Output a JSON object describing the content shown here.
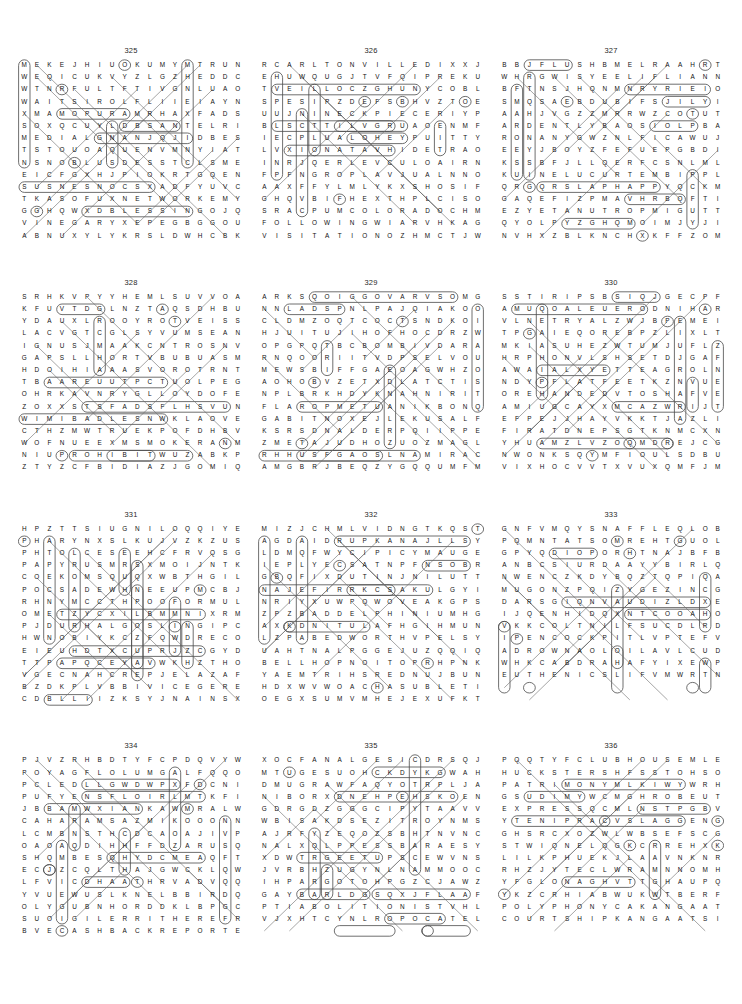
{
  "page": {
    "grid_columns": 18,
    "grid_rows": 15,
    "puzzle_count": 12
  },
  "puzzles": [
    {
      "number": "325",
      "rows": [
        "MEKEJHIUOKUMYMTRUNDU",
        "WEQICUKVYZLGZHEDDCEV",
        "WTNRFULTFTIVGNLUAOTQ",
        "WAITSIROLFLIIEIAYNAI",
        "XMAMOPURAMRHAXFADSUN",
        "SOXQCUYLDBSANTELRIQT",
        "MEDIALGNANJQJIDBESIE",
        "TSTOUOAQUENVMNYIATTR",
        "NSNOBLUSDESSTCLSMENM",
        "EICFGXHJPIOKRTGQENAI",
        "SUSNESNOCSXADFYUVCMN",
        "TKASOFUXNETWORKEMYMG",
        "GGHQWXDBLESSINGOJQIL",
        "VINEGARYXEPEGBGGOUQE",
        "ABNUXYLYKRSLDWHCBKGE"
      ]
    },
    {
      "number": "326",
      "rows": [
        "RCARLTONVILLEDIXXJSB",
        "EHUWQUGJTVFQIPREKURR",
        "TVEILLOCZGHUNYCOBLOE",
        "SPESIPZDEFSBHVZTOEUA",
        "UUJNINECKPIECERIYPST",
        "BLSCTTILVGRUAOENMFTH",
        "IECPLUALOHEYPUITTYAE",
        "LVXIONATAVHIDETRAOBR",
        "INRJQERLEVCULOAIRNOR",
        "FPFNGROPLAVJUALNNOUT",
        "AAXFFYLMLYKXSHOSIFTH",
        "GHQVBIFHEXTHPLCISOGJ",
        "SRACPUMCOLORADOCHMLY",
        "FOLLOWINGWIARVHKAGZK",
        "VISITATIONOZHMCTJWHP"
      ]
    },
    {
      "number": "327",
      "rows": [
        "BBJFLUSHBMELRAAHRTGR",
        "WHRGWISYEELIFLIANNME",
        "BFTNSJHQNMNRYRIEIOSS",
        "SMQSAEBDUBIFSJILYIMU",
        "AAHJVGZZMRRWZCOTUTGR",
        "ARDENTLYBAOSIOLPBAFR",
        "RONANYGWZNLFICAWUJCT",
        "EEYJBOYZFEFUEPGBDIPC",
        "KSSBFJLLQERFCSNLMLZT",
        "KUINELUCURTEMBIPPLML",
        "QRGQRSLAPHAPPYQCKMLJ",
        "GAQEFIZPMAVHRBQFTIRF",
        "EZYETANUTROPMIGUTTAU",
        "QYOLPYZGHQMOIMJYJIFJ",
        "NVHXZBLKNCHXKFFZOMJS"
      ]
    },
    {
      "number": "328",
      "rows": [
        "SRHKVPYYHEMLSUVVOARO",
        "KFUVTDGLNZTAQSDHBUBX",
        "YDAUXLROOYROTVEISSAL",
        "LACVGTCGLSYVUMSEANW",
        "IGNUSJMAAKCNTROSNVQ",
        "GAPSLLHORTVBUBUASMOG",
        "HDOIHIAAASVOROTRNT",
        "TBAAREUUTPCTUOLPEGEAZ",
        "OHRKAVNRYGLLOYDOFEHF",
        "ZOXXSTSFADSFLHSVUNQQ",
        "WIMIBADLESNWKLAOVEMC",
        "CTHZMWTRUEKPOFDHBVNE",
        "WOFNUEEXMSMOKERANMMV",
        "NIUPROHIBITWUZABKPDS",
        "ZTYZCFBIDIAZJGOMIQOC"
      ]
    },
    {
      "number": "329",
      "rows": [
        "ARKSQOIGGOVARVSOMGYR",
        "NNLADSPNLPAJQIAKOOEE",
        "CLDMZOQTCOCTSNDKOIJE",
        "HJUITUJIHOFHOCDRZWTJ",
        "OPGPQTBCBOMBIVDARAAS",
        "RNQOORIITVDPSELVOUUS",
        "MEWSBIFFGAEOAGWHZOFP",
        "AOHOBVZETXDLATCTISEX",
        "NPLBRKHDYKNAHNIRITLT",
        "FLAROPMETUANIKBONQJP",
        "GABITNOXEJLEKUSALFJQ",
        "KSRSDNALDERPQIIPPEUL",
        "ZMETAJUDHOZUOZMAGLJV",
        "RHHUSFGAOSLNAMIRACLE",
        "AMGBRJBEQZYGQQUMFMYX"
      ]
    },
    {
      "number": "330",
      "rows": [
        "SSTIRIPSBSIQJGECPFI",
        "AMUQOALEUERODNIHARN",
        "VLNETRYALZWJBPEMEIA",
        "TPGAIEQOREBPZLIXLTT",
        "MKIASUHEZWTUMJUFLZT",
        "HRPHONVLSHSETDJGAFE",
        "AWAIALXYETTEAGROLN",
        "NDYPFLATFEETKZNVUET",
        "OREHANDEDVTOSHAFVEI",
        "AMIUGCAYXMCAZWRIJTO",
        "EFPEJJHAYVKKTJAZLIN",
        "FIRATDNEPSGTKNMCXNI",
        "YHUAMZLVZOQMDREJCGY",
        "NWONKSQYMFIOULSDBUG",
        "VIXHOCVVTXVUXQMFJMH"
      ]
    },
    {
      "number": "331",
      "rows": [
        "HPZTTSIUGNILOQQIYEVE",
        "PHARYNXSLKUJVZKZUSON",
        "PHTOLCESEEHCFRVQSGPC",
        "PAPYRUSMRSXMOIJNTKI",
        "COEKOMSQUQXWBTHGILSR",
        "POCSADEWHNEEUPMCBJRC",
        "RHNYMCCTHPOOFORMULAL",
        "OMETZYCXILBMMNIXRMRE",
        "PJDURHALGOSLINGIPCAR",
        "HWNOBIYKCZFQWDRECOMG",
        "EIEUHDTXCUPRJZCGYDAH",
        "TTPAPQCEYAVWKHZTHOSJ",
        "VGECNAHCREPJELAZAFEO",
        "BZDKPLVBBIVICEGERENT",
        "CDBLLIIZKSYJNAINSXND"
      ]
    },
    {
      "number": "332",
      "rows": [
        "MIZJCHMLVIDNGTKQSTYK",
        "AGDAIDRUPKANAJLLSYCU",
        "LDMQFWYCIPICYMAUGELU",
        "IEPLYECSATNPFNSOBRPU",
        "GBQFIXDUTINJNILUTTJV",
        "NAJEFIRRKCSAKULGYIQQ",
        "NRIYXUWPQWOVEAKGPSTL",
        "ZPZBADDELPHINIUMHGPO",
        "AXKDNITULAFHGIHMUNHY",
        "LZPABEDWORTHVPELSYTW",
        "UAHTNALPGGEJUZQQIQSV",
        "BELLHOPNOITOPRHPNKXU",
        "YAEMTRIHSREDNUJBUNBY",
        "HDXWVWOACHASUBLETIDL",
        "OEGXSUMVMHEJEXUFKTG"
      ]
    },
    {
      "number": "333",
      "rows": [
        "GNFVMQYSNAFFLEQLOBBP",
        "PQMNTATSOMREHTGUOLXX",
        "GPYQDIOPORHTNAJBFBQD",
        "ANBCSIURDAAYYBIRLQMRR",
        "NWENCZKDYBQZTQPIQAER",
        "MUGONZPQIZYGEZINCGTA",
        "DARSGIQNVAUDIZLDXEDRE",
        "IJQENHIDQXNTCOOAHOAE",
        "VKKCOLTNILFSUCDLRDMS",
        "IPENCOCKPITLVPTEFVUN",
        "ADROWNAOLOILAVLCUDDA",
        "WHKCABDRAHAFYIXEWPZK",
        "EUTHENICSLIFVMWRTNVE"
      ]
    },
    {
      "number": "334",
      "rows": [
        "PJVZRHBDTYFCPDQVYWBY",
        "POYAGFLOLUMGALFQQOSA",
        "PCLEDLLGWDWPXFDCNICD",
        "PUFYENSFLOIRLMTKFIME",
        "JBBAMWXIANKAWMRALWDM",
        "CAHARAMSAZMIKOOONNZO",
        "LCMBNSTHCDCAOAJIVPYS",
        "OAOAQDIHHFFDZARUSQNW",
        "SHQMBESQHYDCMEAQFTAB",
        "ECJZCQLTHAJGWCKLQWEV",
        "LFVICDHAATHRVADVQQBN",
        "YVUEWUSLKNELBBIRDQIZ",
        "OLYGUBNHORDDKLBPGCFD",
        "SUOIGILERRITHEREFROM",
        "BVECASHBACKREPORTERH"
      ]
    },
    {
      "number": "335",
      "rows": [
        "XOCFANALGESICDRSQJFD",
        "MTUGESUOHCKDYKGWAHR",
        "DMUGRAWFAQYOTRPLJAZK",
        "NIBORXDNEHPEHSKOENMRE",
        "GDRGDZGGGCIPYTAAVVRD",
        "WBISAKDSEZITROYNMSRM",
        "AJRFYZEQOZSBHTNVNCI",
        "NALXQLPPESSBARAESYPS",
        "XDWTRGEETUPSCEWVNSHJ",
        "JVRBHZUGYNLNAMMOOCWJ",
        "IHPARGOTOHPGZCJAWZS",
        "GAYBARLDGSQXJFLAAFWE",
        "PTIABOLITIONISTVHLPA",
        "VJXHTCYNLROPOCATELLO"
      ]
    },
    {
      "number": "336",
      "rows": [
        "PQQTYFCLUBHOUSEMLENW",
        "HUCKSTERSHFSSTOHSOMT",
        "PATRIMONYMLKIWYWRHKG",
        "GSUDIMYWCMGHROBEUTEAS",
        "EXPRESSQCMLNSTPGBVAEL",
        "YTENIPRACVSLAGGENGNTO",
        "GHSRCXOZWLWBSEFSCGTEC",
        "STWIQNELQGKCRREHXKRGV",
        "LILKPHUEKJLAAVNKNRWR",
        "RHZJYTECLWRAMNNOMHUE",
        "YFGLONAGHVTTGHAUPQRL",
        "YKZCRHIABWUKWTBERFII",
        "POLYPHONYCAKANGAATSIAQ",
        "COURTSHIPKANGAATSIAQ"
      ]
    }
  ],
  "found_words": {
    "325": [
      "RUNDU",
      "WAITS",
      "MEDIAL",
      "CONSENSUS",
      "NETWORK",
      "BLESSING",
      "VINEGARY"
    ],
    "326": [
      "CARLTONVILLE",
      "COLLIEV",
      "NECKPIECE",
      "COLORADO",
      "FOLLOWING",
      "VISITATION"
    ],
    "327": [
      "FLUSH",
      "ARDENTLY",
      "TRUCULENCE",
      "SLAPHAPPY",
      "IMPORTUNATE"
    ],
    "328": [
      "EISSAL",
      "SMOKER",
      "PROHIBIT"
    ],
    "329": [
      "METAPORAL",
      "REDLANDS",
      "MIRACLE"
    ],
    "330": [
      "SPIRITS",
      "FLATFEET",
      "FOREHANDED",
      "SPENDTHRIFT"
    ],
    "331": [
      "LINGUIST",
      "PHARYNX",
      "CHEESECLOTH",
      "PAPYRUS",
      "SMOKE",
      "SLIGHT",
      "FORMULA",
      "GOSLING",
      "PERCHANCE",
      "VICEGERENT"
    ],
    "332": [
      "PURDUE",
      "KANA",
      "DELPHINIUM",
      "FLATULENT",
      "BEDWORTH",
      "EGGPLANT",
      "BELLHOP",
      "POTION",
      "UNDERSHIRT",
      "CHASUBLE"
    ],
    "333": [
      "SNAFFLE",
      "THERMOSTAT",
      "ANTHROPOID",
      "FLINTLOCK",
      "COCKPIT",
      "LOANWORD",
      "HARDBACK",
      "EUTHENICS"
    ],
    "334": [
      "SAHARA",
      "BIRD",
      "RELIGIOUS",
      "THEREFROM",
      "CASHBACK",
      "REPORTER"
    ],
    "335": [
      "ANALGESIC",
      "HOUSE",
      "SHEPHERD",
      "PHOTOGRAPH",
      "ABOLITIONIST",
      "POCATELLO"
    ],
    "336": [
      "CLUBHOUSE",
      "HUCKSTERS",
      "PATRIMONY",
      "EXPRESS",
      "CARPINETY",
      "POLYPHONY",
      "COURTSHIP",
      "KANGA"
    ]
  }
}
